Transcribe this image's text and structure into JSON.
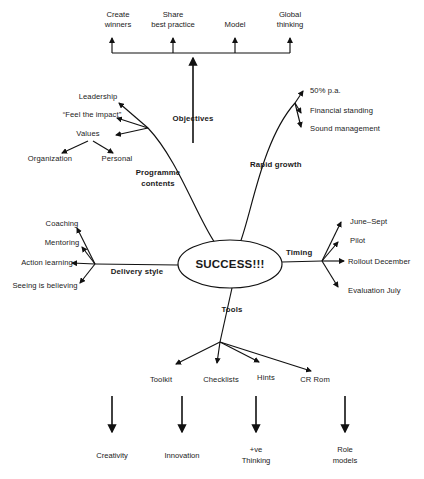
{
  "diagram": {
    "title_center": "SUCCESS!!!",
    "type": "mind-map",
    "objectives": {
      "branch_label": "Objectives",
      "items": [
        {
          "lines": [
            "Create",
            "winners"
          ],
          "x": 118,
          "y_lines": [
            17,
            27
          ]
        },
        {
          "lines": [
            "Share",
            "best practice"
          ],
          "x": 173,
          "y_lines": [
            17,
            27
          ]
        },
        {
          "lines": [
            "Model"
          ],
          "x": 235,
          "y_lines": [
            27
          ]
        },
        {
          "lines": [
            "Global",
            "thinking"
          ],
          "x": 290,
          "y_lines": [
            17,
            27
          ]
        }
      ]
    },
    "programme_contents": {
      "branch_label": "Programme contents",
      "branch_label_lines": [
        "Programme",
        "contents"
      ],
      "items": [
        {
          "label": "Leadership",
          "x": 98,
          "y": 99,
          "anchor": "middle"
        },
        {
          "label": "“Feel the impact”",
          "x": 92,
          "y": 117,
          "anchor": "middle"
        },
        {
          "label": "Values",
          "x": 88,
          "y": 136,
          "anchor": "middle"
        }
      ],
      "values_children": [
        {
          "label": "Organization",
          "x": 50,
          "y": 158,
          "anchor": "middle"
        },
        {
          "label": "Personal",
          "x": 117,
          "y": 158,
          "anchor": "middle"
        }
      ]
    },
    "rapid_growth": {
      "branch_label": "Rapid growth",
      "items": [
        {
          "label": "50% p.a.",
          "x": 308,
          "y": 93
        },
        {
          "label": "Financial standing",
          "x": 308,
          "y": 112
        },
        {
          "label": "Sound management",
          "x": 308,
          "y": 130
        }
      ]
    },
    "delivery_style": {
      "branch_label": "Delivery style",
      "items": [
        {
          "label": "Coaching",
          "x": 58,
          "y": 226
        },
        {
          "label": "Mentoring",
          "x": 58,
          "y": 245
        },
        {
          "label": "Action learning",
          "x": 62,
          "y": 264
        },
        {
          "label": "Seeing is believing",
          "x": 66,
          "y": 283
        }
      ]
    },
    "timing": {
      "branch_label": "Timing",
      "items": [
        {
          "label": "June–Sept",
          "x": 350,
          "y": 224
        },
        {
          "label": "Pilot",
          "x": 350,
          "y": 243
        },
        {
          "label": "Rollout December",
          "x": 350,
          "y": 263
        },
        {
          "label": "Evaluation July",
          "x": 350,
          "y": 292
        }
      ]
    },
    "tools": {
      "branch_label": "Tools",
      "items": [
        {
          "label": "Toolkit",
          "x": 161,
          "y": 380
        },
        {
          "label": "Checklists",
          "x": 221,
          "y": 380
        },
        {
          "label": "Hints",
          "x": 270,
          "y": 380
        },
        {
          "label": "CR Rom",
          "x": 317,
          "y": 380
        }
      ]
    },
    "outcomes": [
      {
        "lines": [
          "Creativity"
        ],
        "x": 112,
        "y_lines": [
          458
        ]
      },
      {
        "lines": [
          "Innovation"
        ],
        "x": 182,
        "y_lines": [
          458
        ]
      },
      {
        "lines": [
          "+ve",
          "Thinking"
        ],
        "x": 256,
        "y_lines": [
          452,
          462
        ]
      },
      {
        "lines": [
          "Role",
          "models"
        ],
        "x": 345,
        "y_lines": [
          452,
          462
        ]
      }
    ],
    "colors": {
      "stroke": "#111111",
      "text": "#1a1a1a",
      "background": "#ffffff"
    }
  }
}
